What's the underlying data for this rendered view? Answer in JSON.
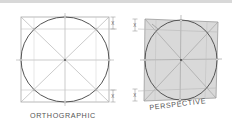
{
  "diagram": {
    "panels": [
      {
        "id": "orthographic",
        "label": "ORTHOGRAPHIC",
        "dimension_marker": "X"
      },
      {
        "id": "perspective",
        "label": "PERSPECTIVE",
        "dimension_marker": "X"
      }
    ],
    "colors": {
      "construction_line": "#b0b0b0",
      "circle_stroke": "#555555",
      "perspective_fill": "#d9d9d9",
      "text": "#555555"
    }
  }
}
